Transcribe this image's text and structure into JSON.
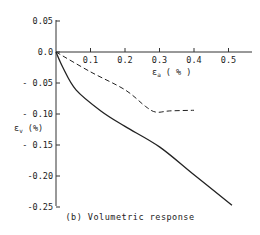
{
  "chart_data": {
    "type": "line",
    "title": "",
    "caption": "(b) Volumetric response",
    "xlabel": "ε_a (%)",
    "ylabel": "ε_v (%)",
    "xlim": [
      0,
      0.57
    ],
    "ylim": [
      -0.25,
      0.05
    ],
    "grid": false,
    "legend": null,
    "x_ticks": [
      0.1,
      0.2,
      0.3,
      0.4,
      0.5
    ],
    "x_tick_labels": [
      "0.1",
      "0.2",
      "0.3",
      "0.4",
      "0.5"
    ],
    "y_ticks": [
      0.05,
      0.0,
      -0.05,
      -0.1,
      -0.15,
      -0.2,
      -0.25
    ],
    "y_tick_labels": [
      "0.05",
      "0.0",
      "- 0.05",
      "- 0.10",
      "- 0.15",
      "-0.20",
      "-0.25"
    ],
    "series": [
      {
        "name": "solid",
        "style": "solid",
        "x": [
          0,
          0.02,
          0.058,
          0.13,
          0.2,
          0.3,
          0.4,
          0.51
        ],
        "y": [
          0,
          -0.025,
          -0.061,
          -0.095,
          -0.12,
          -0.153,
          -0.198,
          -0.247
        ]
      },
      {
        "name": "dashed",
        "style": "dashed",
        "x": [
          0,
          0.1,
          0.2,
          0.26,
          0.29,
          0.33,
          0.4
        ],
        "y": [
          0,
          -0.032,
          -0.061,
          -0.088,
          -0.097,
          -0.095,
          -0.094
        ]
      }
    ]
  },
  "labels": {
    "x_axis": "ε",
    "x_axis_sub": "a",
    "x_axis_unit": " ( % )",
    "y_axis": "ε",
    "y_axis_sub": "v",
    "y_axis_unit": " (%)",
    "caption": "(b) Volumetric response"
  }
}
